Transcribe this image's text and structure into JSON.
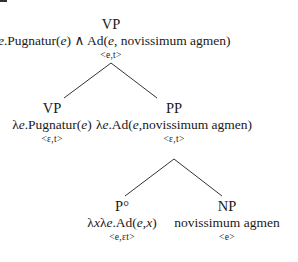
{
  "tree": {
    "root": {
      "category": "VP",
      "semantics_parts": [
        "λ",
        "e",
        ".Pugnatur(",
        "e",
        ") ∧ Ad(",
        "e",
        ", novissimum agmen)"
      ],
      "type": "<e,t>"
    },
    "left": {
      "category": "VP",
      "semantics_parts": [
        "λ",
        "e",
        ".Pugnatur(",
        "e",
        ")"
      ],
      "type": "<ε,t>"
    },
    "right": {
      "category": "PP",
      "semantics_parts": [
        "λ",
        "e",
        ".Ad(",
        "e",
        ",novissimum agmen)"
      ],
      "type": "<ε,t>"
    },
    "p_head": {
      "category": "P°",
      "semantics_parts": [
        "λ",
        "x",
        "λ",
        "e",
        ".Ad(",
        "e",
        ",",
        "x",
        ")"
      ],
      "type": "<e,εt>"
    },
    "np": {
      "category": "NP",
      "semantics": "novissimum agmen",
      "type": "<e>"
    }
  }
}
